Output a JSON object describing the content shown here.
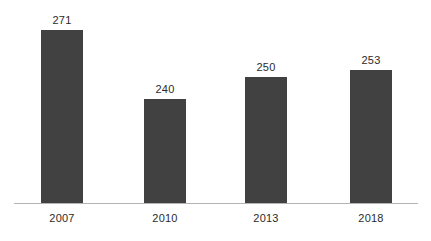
{
  "chart_data": {
    "type": "bar",
    "title": "",
    "subtitle": "",
    "xlabel": "",
    "ylabel": "",
    "categories": [
      "2007",
      "2010",
      "2013",
      "2018"
    ],
    "values": [
      271,
      240,
      250,
      253
    ],
    "value_labels": [
      "271",
      "240",
      "250",
      "253"
    ],
    "ylim": [
      193,
      293
    ],
    "grid": false,
    "legend": null,
    "annotations": [],
    "series": [
      {
        "name": "",
        "values": [
          271,
          240,
          250,
          253
        ]
      }
    ]
  },
  "style": {
    "bar_color": "#414141",
    "axis_color": "#b3b3b3",
    "label_color": "#2b2b2b",
    "background": "#ffffff"
  },
  "geometry": {
    "baseline_y": 203,
    "axis_x_start": 14,
    "axis_x_end": 418,
    "bar_width": 42,
    "bar_lefts": [
      41,
      144,
      245,
      350
    ],
    "bar_tops": [
      30,
      137,
      100,
      92
    ],
    "tick_label_y": 212,
    "value_label_offset": 16
  }
}
